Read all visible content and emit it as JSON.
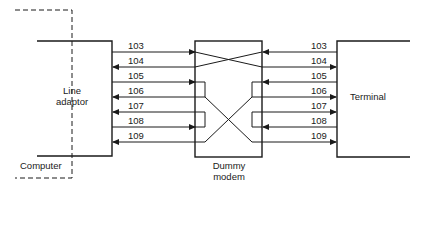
{
  "diagram": {
    "blocks": {
      "line_adaptor": "Line adaptor",
      "line_adaptor_l1": "Line",
      "line_adaptor_l2": "adaptor",
      "computer": "Computer",
      "dummy_modem_l1": "Dummy",
      "dummy_modem_l2": "modem",
      "terminal": "Terminal"
    },
    "left_signals": [
      "103",
      "104",
      "105",
      "106",
      "107",
      "108",
      "109"
    ],
    "right_signals": [
      "103",
      "104",
      "105",
      "106",
      "107",
      "108",
      "109"
    ],
    "connections": [
      {
        "from": "103 (computer)",
        "to": "104 (terminal)",
        "type": "crossover"
      },
      {
        "from": "104 (computer)",
        "to": "103 (terminal)",
        "type": "crossover"
      },
      {
        "from": "105 (computer)",
        "to": "106 (computer)",
        "type": "loopback"
      },
      {
        "from": "108 (computer)",
        "to": "107 (computer)",
        "type": "loopback"
      },
      {
        "from": "106 (computer)",
        "to": "109 (terminal)",
        "type": "crossover"
      },
      {
        "from": "109 (computer)",
        "to": "106 (terminal)",
        "type": "crossover"
      },
      {
        "from": "105 (terminal)",
        "to": "106 (terminal)",
        "type": "loopback"
      },
      {
        "from": "108 (terminal)",
        "to": "107 (terminal)",
        "type": "loopback"
      }
    ]
  }
}
